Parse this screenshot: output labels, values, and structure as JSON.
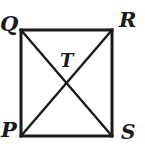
{
  "figure": {
    "kind": "geometry-diagram",
    "background_color": "#ffffff",
    "stroke_color": "#1a1a1a",
    "label_color": "#1a1a1a",
    "rectangle_stroke_width": 3,
    "diagonal_stroke_width": 2.4,
    "rectangle": {
      "left": 21,
      "top": 30,
      "right": 112,
      "bottom": 136
    },
    "intersection": {
      "x": 66.5,
      "y": 83
    },
    "vertices": [
      {
        "id": "Q",
        "label": "Q",
        "corner": "top-left",
        "x": 21,
        "y": 30
      },
      {
        "id": "R",
        "label": "R",
        "corner": "top-right",
        "x": 112,
        "y": 30
      },
      {
        "id": "P",
        "label": "P",
        "corner": "bottom-left",
        "x": 21,
        "y": 136
      },
      {
        "id": "S",
        "label": "S",
        "corner": "bottom-right",
        "x": 112,
        "y": 136
      }
    ],
    "interior_points": [
      {
        "id": "T",
        "label": "T",
        "x": 66.5,
        "y": 83
      }
    ],
    "edges": [
      {
        "id": "QR",
        "from": "Q",
        "to": "R",
        "type": "side"
      },
      {
        "id": "RS",
        "from": "R",
        "to": "S",
        "type": "side"
      },
      {
        "id": "SP",
        "from": "S",
        "to": "P",
        "type": "side"
      },
      {
        "id": "PQ",
        "from": "P",
        "to": "Q",
        "type": "side"
      },
      {
        "id": "QS",
        "from": "Q",
        "to": "S",
        "type": "diagonal"
      },
      {
        "id": "PR",
        "from": "P",
        "to": "R",
        "type": "diagonal"
      }
    ]
  }
}
